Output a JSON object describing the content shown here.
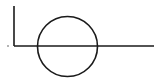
{
  "diagram": {
    "background": "#ffffff",
    "stroke_color": "#1a1a1a",
    "vertical_line": {
      "x": 14,
      "y1": 6,
      "y2": 46
    },
    "horizontal_line": {
      "x1": 14,
      "x2": 154,
      "y": 46
    },
    "circle": {
      "cx": 67.5,
      "cy": 46.5,
      "r": 30
    },
    "dot": {
      "cx": 8,
      "cy": 46,
      "r": 0.8
    }
  }
}
